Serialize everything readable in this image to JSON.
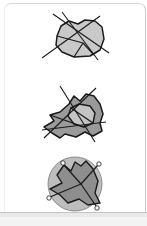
{
  "figure": {
    "background": "#ffffff",
    "card_border": "#c9c9c9",
    "bottom_band": "#e9e9e9",
    "stroke": "#1a1a1a",
    "fill_light": "#c9c9c9",
    "fill_mid": "#bdbdbd",
    "fill_dark": "#9a9a9a",
    "circle_stroke": "#8c8c8c",
    "marker_label": "o"
  },
  "panels": [
    {
      "name": "panel-convex-polygon-with-transversals",
      "caption": "",
      "shape": {
        "type": "polygon",
        "fill": "#c9c9c9",
        "points": "19,28 23,18 31,13 40,16 47,12 57,13 64,19 66,31 62,42 52,48 36,49 24,44 18,37"
      },
      "inner_edges": [
        "19,28 45,35",
        "45,35 36,49",
        "45,35 56,47",
        "45,35 40,16"
      ],
      "lines": [
        {
          "name": "transversal-1",
          "x1": 4,
          "y1": 50,
          "x2": 62,
          "y2": 8
        },
        {
          "name": "transversal-2",
          "x1": 24,
          "y1": 4,
          "x2": 60,
          "y2": 52
        },
        {
          "name": "transversal-3",
          "x1": 15,
          "y1": 6,
          "x2": 71,
          "y2": 45
        }
      ]
    },
    {
      "name": "panel-nonconvex-polygon-with-kernel",
      "caption": "",
      "shape": {
        "type": "polygon",
        "fill": "#9a9a9a",
        "points": "31,22 36,14 42,19 48,12 56,14 62,22 65,32 62,41 64,49 55,54 47,50 38,55 27,52 22,56 14,51 6,45 16,39 12,33 22,30"
      },
      "inner_shape": {
        "type": "polygon",
        "fill": "#c4c4c4",
        "points": "33,26 41,22 52,24 57,31 55,41 46,45 36,42 30,34"
      },
      "inner_edges": [
        "12,33 46,45",
        "33,26 55,41",
        "22,56 41,22",
        "6,45 48,12"
      ],
      "lines": [
        {
          "name": "transversal-1",
          "x1": 6,
          "y1": 56,
          "x2": 58,
          "y2": 6
        },
        {
          "name": "transversal-2",
          "x1": 22,
          "y1": 4,
          "x2": 57,
          "y2": 60
        },
        {
          "name": "transversal-3",
          "x1": 4,
          "y1": 48,
          "x2": 68,
          "y2": 40
        }
      ]
    },
    {
      "name": "panel-circumscribed-circle-with-markers",
      "caption": "",
      "circle": {
        "cx": 45,
        "cy": 33,
        "r": 27,
        "fill": "#bdbdbd",
        "stroke": "#8c8c8c"
      },
      "shape": {
        "type": "polygon",
        "fill": "#8e8e8e",
        "points": "26,14 33,20 37,11 43,15 48,10 55,18 60,30 57,42 62,52 50,54 41,48 30,52 22,44 12,38 24,32 19,24"
      },
      "inner_edges": [
        "43,33 26,14",
        "43,33 60,14",
        "43,33 12,46",
        "43,33 58,55"
      ],
      "markers": [
        {
          "name": "marker-top-left",
          "cx": 25,
          "cy": 12,
          "label": "o"
        },
        {
          "name": "marker-top-right",
          "cx": 61,
          "cy": 13,
          "label": "o"
        },
        {
          "name": "marker-bottom-left",
          "cx": 11,
          "cy": 47,
          "label": "o"
        },
        {
          "name": "marker-bottom-right",
          "cx": 59,
          "cy": 57,
          "label": "o"
        }
      ]
    }
  ]
}
